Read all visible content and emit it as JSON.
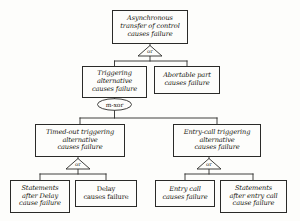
{
  "diagram": {
    "type": "fault-tree",
    "background_color": "#fdfdfb",
    "line_color": "#2a2a28",
    "text_color": "#16150f"
  },
  "nodes": {
    "root": {
      "id": "asynchronous-transfer-of-control",
      "lines": [
        "Asynchronous",
        "transfer of control",
        "causes failure"
      ],
      "style": "italic",
      "font_size": 6.6,
      "x": 112,
      "y": 10,
      "w": 76,
      "h": 34
    },
    "triggering_alternative": {
      "id": "triggering-alternative",
      "lines": [
        "Triggering",
        "alternative",
        "causes failure"
      ],
      "style": "italic",
      "font_size": 6.6,
      "x": 82,
      "y": 66,
      "w": 65,
      "h": 32
    },
    "abortable_part": {
      "id": "abortable-part",
      "lines": [
        "Abortable part",
        "causes failure"
      ],
      "style": "italic",
      "font_size": 6.6,
      "x": 154,
      "y": 66,
      "w": 66,
      "h": 28
    },
    "timed_out_triggering": {
      "id": "timed-out-triggering-alternative",
      "lines": [
        "Timed-out triggering",
        "alternative",
        "causes failure"
      ],
      "style": "italic",
      "font_size": 6.6,
      "x": 35,
      "y": 124,
      "w": 90,
      "h": 33
    },
    "entry_call_triggering": {
      "id": "entry-call-triggering-alternative",
      "lines": [
        "Entry-call triggering",
        "alternative",
        "causes failure"
      ],
      "style": "italic",
      "font_size": 6.6,
      "x": 173,
      "y": 124,
      "w": 88,
      "h": 33
    },
    "statements_after_delay": {
      "id": "statements-after-delay",
      "lines": [
        "Statements",
        "after Delay",
        "cause failure"
      ],
      "style": "italic",
      "font_size": 6.6,
      "x": 10,
      "y": 180,
      "w": 60,
      "h": 33
    },
    "delay_causes_failure": {
      "id": "delay-causes-failure",
      "lines": [
        "Delay",
        "causes failure"
      ],
      "style": "roman",
      "font_size": 6.6,
      "x": 75,
      "y": 180,
      "w": 62,
      "h": 27
    },
    "entry_call": {
      "id": "entry-call-causes-failure",
      "lines": [
        "Entry call",
        "causes failure"
      ],
      "style": "italic",
      "font_size": 6.6,
      "x": 155,
      "y": 180,
      "w": 60,
      "h": 27
    },
    "statements_after_entry_call": {
      "id": "statements-after-entry-call",
      "lines": [
        "Statements",
        "after entry call",
        "cause failure"
      ],
      "style": "italic",
      "font_size": 6.6,
      "x": 220,
      "y": 180,
      "w": 67,
      "h": 33
    }
  },
  "gates": {
    "root_or": {
      "id": "root-or-gate",
      "label": "or",
      "shape": "triangle",
      "apex_x": 150,
      "apex_y": 45,
      "half_w": 12,
      "base_y": 56
    },
    "m_xor": {
      "id": "m-xor-gate",
      "label": "m-xor",
      "shape": "ellipse",
      "cx": 114,
      "cy": 104,
      "rx": 17,
      "ry": 6
    },
    "timed_out_or": {
      "id": "timed-out-or-gate",
      "label": "or",
      "shape": "triangle",
      "apex_x": 78,
      "apex_y": 158,
      "half_w": 12,
      "base_y": 169
    },
    "entry_call_or": {
      "id": "entry-call-or-gate",
      "label": "or",
      "shape": "triangle",
      "apex_x": 209,
      "apex_y": 158,
      "half_w": 12,
      "base_y": 169
    }
  },
  "connections": [
    {
      "from": "root",
      "to": "root_or",
      "type": "vertical"
    },
    {
      "from": "root_or",
      "to": "triggering_alternative",
      "type": "fork"
    },
    {
      "from": "root_or",
      "to": "abortable_part",
      "type": "fork"
    },
    {
      "from": "triggering_alternative",
      "to": "m_xor",
      "type": "vertical"
    },
    {
      "from": "m_xor",
      "to": "timed_out_triggering",
      "type": "fork"
    },
    {
      "from": "m_xor",
      "to": "entry_call_triggering",
      "type": "fork"
    },
    {
      "from": "timed_out_triggering",
      "to": "timed_out_or",
      "type": "vertical"
    },
    {
      "from": "timed_out_or",
      "to": "statements_after_delay",
      "type": "fork"
    },
    {
      "from": "timed_out_or",
      "to": "delay_causes_failure",
      "type": "fork"
    },
    {
      "from": "entry_call_triggering",
      "to": "entry_call_or",
      "type": "vertical"
    },
    {
      "from": "entry_call_or",
      "to": "entry_call",
      "type": "fork"
    },
    {
      "from": "entry_call_or",
      "to": "statements_after_entry_call",
      "type": "fork"
    }
  ]
}
